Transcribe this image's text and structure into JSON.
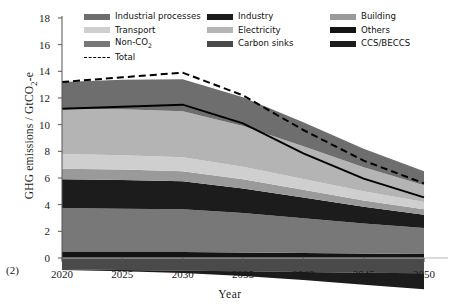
{
  "panel_tag": "(2)",
  "axes": {
    "ylabel": "GHG emissions / GtCO₂-e",
    "xlabel": "Year",
    "yticks": [
      0,
      2,
      4,
      6,
      8,
      10,
      12,
      14,
      16,
      18
    ],
    "xticks": [
      2020,
      2025,
      2030,
      2035,
      2040,
      2045,
      2050
    ]
  },
  "legend": {
    "columns": [
      [
        {
          "label": "Industrial processes",
          "color": "#6e6e6e",
          "style": "fill"
        },
        {
          "label": "Transport",
          "color": "#cfcfcf",
          "style": "fill"
        },
        {
          "label": "Non-CO₂",
          "color": "#787878",
          "style": "fill"
        },
        {
          "label": "Total",
          "color": "#000000",
          "style": "dashed"
        }
      ],
      [
        {
          "label": "Industry",
          "color": "#1c1c1c",
          "style": "fill"
        },
        {
          "label": "Electricity",
          "color": "#b4b4b4",
          "style": "fill"
        },
        {
          "label": "Carbon sinks",
          "color": "#4a4a4a",
          "style": "fill"
        }
      ],
      [
        {
          "label": "Building",
          "color": "#9a9a9a",
          "style": "fill"
        },
        {
          "label": "Others",
          "color": "#141414",
          "style": "fill"
        },
        {
          "label": "CCS/BECCS",
          "color": "#1c1c1c",
          "style": "fill"
        }
      ]
    ]
  },
  "colors": {
    "industrial_processes": "#6e6e6e",
    "transport": "#cfcfcf",
    "non_co2": "#787878",
    "industry": "#1c1c1c",
    "electricity": "#b4b4b4",
    "carbon_sinks": "#4a4a4a",
    "building": "#9a9a9a",
    "others": "#141414",
    "ccs_beccs": "#1c1c1c",
    "total_line": "#000000",
    "axis": "#555555"
  },
  "chart_data": {
    "type": "area",
    "title": "",
    "xlabel": "Year",
    "ylabel": "GHG emissions / GtCO₂-e",
    "xlim": [
      2020,
      2050
    ],
    "ylim": [
      -2.2,
      18
    ],
    "grid": false,
    "legend_position": "top",
    "stacking": "stacked",
    "x": [
      2020,
      2025,
      2030,
      2035,
      2040,
      2045,
      2050
    ],
    "series": [
      {
        "name": "Others",
        "values": [
          0.45,
          0.45,
          0.45,
          0.42,
          0.38,
          0.34,
          0.3
        ]
      },
      {
        "name": "Non-CO₂",
        "values": [
          3.3,
          3.25,
          3.2,
          2.95,
          2.6,
          2.25,
          1.95
        ]
      },
      {
        "name": "Industry",
        "values": [
          2.15,
          2.15,
          2.1,
          1.85,
          1.55,
          1.25,
          1.0
        ]
      },
      {
        "name": "Building",
        "values": [
          0.8,
          0.78,
          0.75,
          0.68,
          0.58,
          0.48,
          0.4
        ]
      },
      {
        "name": "Transport",
        "values": [
          1.1,
          1.08,
          1.05,
          0.95,
          0.82,
          0.68,
          0.55
        ]
      },
      {
        "name": "Electricity",
        "values": [
          3.4,
          3.45,
          3.45,
          3.05,
          2.45,
          1.8,
          1.25
        ]
      },
      {
        "name": "Industrial processes",
        "values": [
          2.0,
          2.2,
          2.4,
          2.15,
          1.8,
          1.4,
          1.05
        ]
      }
    ],
    "negative_series": [
      {
        "name": "Carbon sinks",
        "values": [
          -0.85,
          -0.9,
          -0.95,
          -1.0,
          -1.05,
          -1.1,
          -1.15
        ]
      },
      {
        "name": "CCS/BECCS",
        "values": [
          -0.05,
          -0.1,
          -0.18,
          -0.35,
          -0.6,
          -0.9,
          -1.2
        ]
      }
    ],
    "total_line": {
      "name": "Total",
      "values": [
        13.2,
        13.55,
        13.9,
        12.2,
        9.6,
        7.3,
        5.6
      ],
      "style": "dashed"
    },
    "inner_solid_line": {
      "name": "stack-boundary",
      "values": [
        11.2,
        11.35,
        11.5,
        10.1,
        7.85,
        5.95,
        4.55
      ]
    }
  }
}
